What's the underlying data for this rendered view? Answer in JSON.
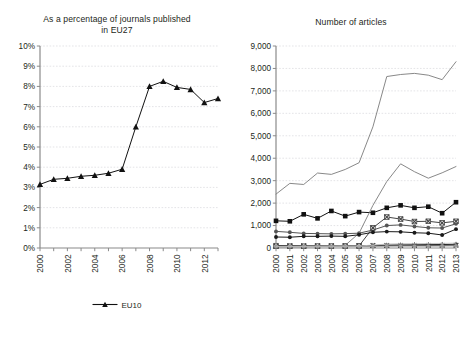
{
  "chart_data": [
    {
      "id": "left",
      "type": "line",
      "title": "As a percentage of journals published in EU27",
      "title_lines": [
        "As a percentage of journals published",
        "in EU27"
      ],
      "xlabel": "",
      "ylabel": "",
      "x": [
        2000,
        2001,
        2002,
        2003,
        2004,
        2005,
        2006,
        2007,
        2008,
        2009,
        2010,
        2011,
        2012,
        2013
      ],
      "xtick_labels": [
        "2000",
        "2002",
        "2004",
        "2006",
        "2008",
        "2010",
        "2012"
      ],
      "xtick_values": [
        2000,
        2002,
        2004,
        2006,
        2008,
        2010,
        2012
      ],
      "ytick_labels": [
        "0%",
        "1%",
        "2%",
        "3%",
        "4%",
        "5%",
        "6%",
        "7%",
        "8%",
        "9%",
        "10%"
      ],
      "ytick_values": [
        0,
        1,
        2,
        3,
        4,
        5,
        6,
        7,
        8,
        9,
        10
      ],
      "ylim": [
        0,
        10
      ],
      "xlim": [
        2000,
        2013
      ],
      "grid": true,
      "legend_position": "bottom",
      "series": [
        {
          "name": "EU10",
          "color": "#111111",
          "marker": "triangle",
          "values": [
            3.15,
            3.4,
            3.45,
            3.55,
            3.6,
            3.7,
            3.9,
            6.0,
            8.0,
            8.25,
            7.95,
            7.85,
            7.2,
            7.4
          ]
        }
      ]
    },
    {
      "id": "right",
      "type": "line",
      "title": "Number of articles",
      "title_lines": [
        "Number of articles"
      ],
      "xlabel": "",
      "ylabel": "",
      "x": [
        2000,
        2001,
        2002,
        2003,
        2004,
        2005,
        2006,
        2007,
        2008,
        2009,
        2010,
        2011,
        2012,
        2013
      ],
      "xtick_labels": [
        "2000",
        "2001",
        "2002",
        "2003",
        "2004",
        "2005",
        "2006",
        "2007",
        "2008",
        "2009",
        "2010",
        "2011",
        "2012",
        "2013"
      ],
      "xtick_values": [
        2000,
        2001,
        2002,
        2003,
        2004,
        2005,
        2006,
        2007,
        2008,
        2009,
        2010,
        2011,
        2012,
        2013
      ],
      "ytick_labels": [
        "0",
        "1,000",
        "2,000",
        "3,000",
        "4,000",
        "5,000",
        "6,000",
        "7,000",
        "8,000",
        "9,000"
      ],
      "ytick_values": [
        0,
        1000,
        2000,
        3000,
        4000,
        5000,
        6000,
        7000,
        8000,
        9000
      ],
      "ylim": [
        0,
        9000
      ],
      "xlim": [
        2000,
        2013
      ],
      "grid": true,
      "legend_position": "bottom",
      "series": [
        {
          "name": "BG",
          "color": "#555555",
          "marker": "dot",
          "values": [
            740,
            700,
            650,
            640,
            630,
            640,
            660,
            800,
            1000,
            1030,
            960,
            900,
            890,
            1080
          ]
        },
        {
          "name": "CZ",
          "color": "#111111",
          "marker": "square",
          "values": [
            1210,
            1190,
            1500,
            1320,
            1650,
            1420,
            1600,
            1570,
            1790,
            1900,
            1790,
            1840,
            1550,
            2040
          ]
        },
        {
          "name": "EE",
          "color": "#222222",
          "marker": "triangle",
          "values": [
            60,
            60,
            60,
            65,
            70,
            75,
            80,
            110,
            130,
            140,
            145,
            150,
            155,
            165
          ]
        },
        {
          "name": "HU",
          "color": "#333333",
          "marker": "cross",
          "values": [
            110,
            105,
            100,
            100,
            100,
            100,
            100,
            110,
            115,
            115,
            115,
            115,
            115,
            120
          ]
        },
        {
          "name": "LT",
          "color": "#444444",
          "marker": "xbox",
          "values": [
            80,
            80,
            80,
            85,
            85,
            90,
            95,
            900,
            1380,
            1290,
            1180,
            1190,
            1120,
            1190
          ]
        },
        {
          "name": "LV",
          "color": "#9a9a9a",
          "marker": "dot",
          "values": [
            60,
            60,
            60,
            60,
            60,
            60,
            65,
            70,
            80,
            85,
            85,
            85,
            90,
            95
          ]
        },
        {
          "name": "PL",
          "color": "#7a7a7a",
          "marker": "none",
          "values": [
            2400,
            2880,
            2830,
            3340,
            3280,
            3500,
            3800,
            5400,
            7640,
            7730,
            7780,
            7700,
            7500,
            8300
          ]
        },
        {
          "name": "RO",
          "color": "#7a7a7a",
          "marker": "none",
          "values": [
            70,
            70,
            75,
            80,
            95,
            120,
            660,
            1900,
            2960,
            3750,
            3400,
            3110,
            3350,
            3630
          ]
        },
        {
          "name": "SI",
          "color": "#bdbdbd",
          "marker": "none",
          "values": [
            70,
            70,
            70,
            75,
            80,
            85,
            90,
            130,
            175,
            190,
            195,
            200,
            205,
            215
          ]
        },
        {
          "name": "SK",
          "color": "#1a1a1a",
          "marker": "dot",
          "values": [
            490,
            480,
            520,
            520,
            530,
            520,
            590,
            700,
            730,
            720,
            680,
            660,
            580,
            840
          ]
        }
      ]
    }
  ]
}
